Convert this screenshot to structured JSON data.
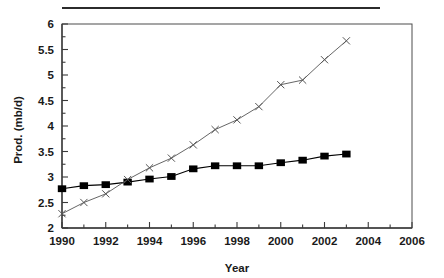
{
  "figure": {
    "top_rule": true,
    "background_color": "#ffffff",
    "frame_color": "#4d4d4d",
    "axis_color": "#3a3a3a"
  },
  "chart_data": {
    "type": "line",
    "title": "",
    "xlabel": "Year",
    "ylabel": "Prod. (mb/d)",
    "xlim": [
      1990,
      2006
    ],
    "ylim": [
      2,
      6
    ],
    "x_major_step": 2,
    "x_minor_step": 1,
    "y_major_step": 0.5,
    "y_minor_step": 0.25,
    "grid": false,
    "legend": "none",
    "x_tick_labels": [
      "1990",
      "1992",
      "1994",
      "1996",
      "1998",
      "2000",
      "2002",
      "2004",
      "2006"
    ],
    "y_tick_labels": [
      "2",
      "2.5",
      "3",
      "3.5",
      "4",
      "4.5",
      "5",
      "5.5",
      "6"
    ],
    "x": [
      1990,
      1991,
      1992,
      1993,
      1994,
      1995,
      1996,
      1997,
      1998,
      1999,
      2000,
      2001,
      2002,
      2003
    ],
    "series": [
      {
        "name": "series-squares",
        "marker": "filled-square",
        "color": "#000000",
        "values": [
          2.77,
          2.83,
          2.85,
          2.9,
          2.96,
          3.01,
          3.16,
          3.22,
          3.22,
          3.22,
          3.28,
          3.33,
          3.41,
          3.45
        ]
      },
      {
        "name": "series-crosses",
        "marker": "x-cross",
        "color": "#555555",
        "values": [
          2.28,
          2.5,
          2.67,
          2.95,
          3.18,
          3.37,
          3.63,
          3.93,
          4.12,
          4.38,
          4.81,
          4.9,
          5.3,
          5.67
        ]
      }
    ]
  }
}
